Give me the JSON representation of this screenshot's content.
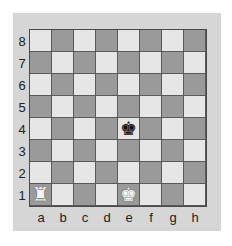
{
  "board": {
    "ranks": [
      "8",
      "7",
      "6",
      "5",
      "4",
      "3",
      "2",
      "1"
    ],
    "files": [
      "a",
      "b",
      "c",
      "d",
      "e",
      "f",
      "g",
      "h"
    ],
    "colors": {
      "light": "#e6e6e6",
      "dark": "#9a9a9a",
      "frame": "#d6d6d6"
    },
    "pieces": [
      {
        "square": "a1",
        "color": "white",
        "type": "rook",
        "glyph": "♜"
      },
      {
        "square": "e1",
        "color": "white",
        "type": "king",
        "glyph": "♚"
      },
      {
        "square": "e4",
        "color": "black",
        "type": "king",
        "glyph": "♚"
      }
    ]
  }
}
